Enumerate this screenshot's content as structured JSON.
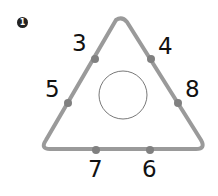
{
  "problem": {
    "number": "1"
  },
  "diagram": {
    "shape": "triangle",
    "center_circle": "empty",
    "stroke_color": "#9a9a9a",
    "dot_color": "#808080",
    "labels": {
      "left_upper": "3",
      "right_upper": "4",
      "left_lower": "5",
      "right_lower": "8",
      "bottom_left": "7",
      "bottom_right": "6"
    }
  }
}
